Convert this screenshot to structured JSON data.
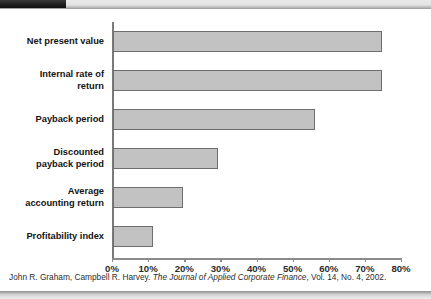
{
  "chart_data": {
    "type": "bar",
    "orientation": "horizontal",
    "title": "",
    "xlabel": "",
    "ylabel": "",
    "categories": [
      "Net present value",
      "Internal rate of return",
      "Payback period",
      "Discounted payback period",
      "Average accounting return",
      "Profitability index"
    ],
    "values": [
      74.5,
      74.5,
      56.0,
      29.0,
      19.5,
      11.0
    ],
    "xlim": [
      0,
      80
    ],
    "xticks": [
      0,
      10,
      20,
      30,
      40,
      50,
      60,
      70,
      80
    ],
    "xtick_labels": [
      "0%",
      "10%",
      "20%",
      "30%",
      "40%",
      "50%",
      "60%",
      "70%",
      "80%"
    ],
    "grid": false,
    "legend": "none",
    "bar_color": "#c2c2c2",
    "bar_border_color": "#6e6e6e",
    "axis_color": "#8a8a8a"
  },
  "category_label_lines": [
    [
      "Net present value"
    ],
    [
      "Internal rate of",
      "return"
    ],
    [
      "Payback period"
    ],
    [
      "Discounted",
      "payback period"
    ],
    [
      "Average",
      "accounting return"
    ],
    [
      "Profitability index"
    ]
  ],
  "citation": {
    "authors": "John R. Graham, Campbell R. Harvey.",
    "journal": "The Journal of Applied Corporate Finance",
    "volume_info": ", Vol. 14, No. 4, 2002."
  }
}
